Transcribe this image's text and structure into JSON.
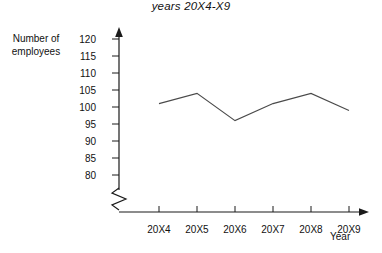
{
  "chart_data": {
    "type": "line",
    "title": "years 20X4-X9",
    "xlabel": "Year",
    "ylabel": "Number of employees",
    "categories": [
      "20X4",
      "20X5",
      "20X6",
      "20X7",
      "20X8",
      "20X9"
    ],
    "values": [
      101,
      104,
      96,
      101,
      104,
      99
    ],
    "series": [
      {
        "name": "Number of employees",
        "values": [
          101,
          104,
          96,
          101,
          104,
          99
        ]
      }
    ],
    "ylim": [
      80,
      120
    ],
    "y_ticks": [
      120,
      115,
      110,
      105,
      100,
      95,
      90,
      85,
      80
    ],
    "y_axis_break": true,
    "grid": false,
    "legend": false,
    "axis_arrows": true
  },
  "labels": {
    "y_axis_title_line1": "Number of",
    "y_axis_title_line2": "employees",
    "x_axis_title": "Year"
  },
  "colors": {
    "line": "#4a4a4a",
    "axis": "#1a1a1a",
    "text": "#111111",
    "background": "#ffffff"
  }
}
